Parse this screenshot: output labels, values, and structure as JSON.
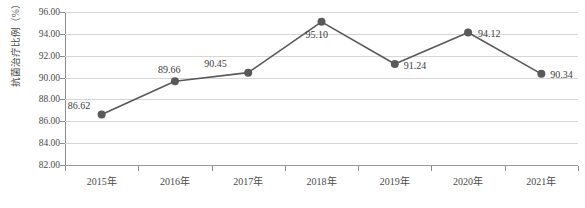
{
  "chart_data": {
    "type": "line",
    "title": "",
    "xlabel": "",
    "ylabel": "抗菌治疗比例（%）",
    "categories": [
      "2015年",
      "2016年",
      "2017年",
      "2018年",
      "2019年",
      "2020年",
      "2021年"
    ],
    "values": [
      86.62,
      89.66,
      90.45,
      95.1,
      91.24,
      94.12,
      90.34
    ],
    "data_labels": [
      "86.62",
      "89.66",
      "90.45",
      "95.10",
      "91.24",
      "94.12",
      "90.34"
    ],
    "series": [
      {
        "name": "抗菌治疗比例",
        "values": [
          86.62,
          89.66,
          90.45,
          95.1,
          91.24,
          94.12,
          90.34
        ]
      }
    ],
    "ylim": [
      82.0,
      96.0
    ],
    "ytick_step": 2.0,
    "ytick_labels": [
      "96.00",
      "94.00",
      "92.00",
      "90.00",
      "88.00",
      "86.00",
      "84.00",
      "82.00"
    ],
    "ytick_values": [
      96.0,
      94.0,
      92.0,
      90.0,
      88.0,
      86.0,
      84.0,
      82.0
    ],
    "grid": true,
    "legend": "none",
    "colors": {
      "line": "#595959",
      "marker": "#595959",
      "gridline": "#d6d6d6",
      "axis": "#8c8c8c",
      "text": "#3c3c3c",
      "background": "#ffffff"
    },
    "label_offsets": [
      {
        "dx": -34,
        "dy": -15
      },
      {
        "dx": -17,
        "dy": -17
      },
      {
        "dx": -44,
        "dy": -15
      },
      {
        "dx": -16,
        "dy": 7
      },
      {
        "dx": 9,
        "dy": -4
      },
      {
        "dx": 10,
        "dy": -5
      },
      {
        "dx": 9,
        "dy": -5
      }
    ]
  }
}
